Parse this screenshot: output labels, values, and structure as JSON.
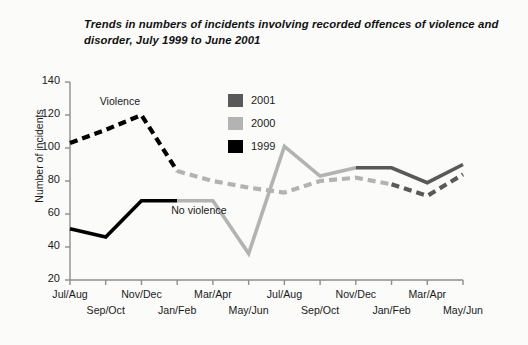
{
  "chart_data": {
    "type": "line",
    "title": "Trends in numbers of incidents involving recorded offences of violence and disorder, July 1999 to June 2001",
    "xlabel": "",
    "ylabel": "Number of incidents",
    "ylim": [
      20,
      140
    ],
    "ytick_values": [
      20,
      40,
      60,
      80,
      100,
      120,
      140
    ],
    "grid": false,
    "legend_position": "inside-top-right",
    "categories": [
      "Jul/Aug",
      "Sep/Oct",
      "Nov/Dec",
      "Jan/Feb",
      "Mar/Apr",
      "May/Jun",
      "Jul/Aug",
      "Sep/Oct",
      "Nov/Dec",
      "Jan/Feb",
      "Mar/Apr",
      "May/Jun"
    ],
    "legend": [
      {
        "label": "2001",
        "color": "#595959"
      },
      {
        "label": "2000",
        "color": "#b3b3b3"
      },
      {
        "label": "1999",
        "color": "#000000"
      }
    ],
    "annotations": [
      {
        "text": "Violence",
        "category_index": 1,
        "value": 128
      },
      {
        "text": "No violence",
        "category_index": 3,
        "value": 62
      }
    ],
    "series": [
      {
        "name": "Violence",
        "style": "dashed",
        "values": [
          103,
          111,
          120,
          86,
          80,
          76,
          73,
          80,
          82,
          78,
          71,
          84
        ],
        "segments": [
          {
            "year": "1999",
            "color": "#000000",
            "from": 0,
            "to": 3
          },
          {
            "year": "2000",
            "color": "#b3b3b3",
            "from": 3,
            "to": 9
          },
          {
            "year": "2001",
            "color": "#595959",
            "from": 9,
            "to": 11
          }
        ]
      },
      {
        "name": "No violence",
        "style": "solid",
        "values": [
          51,
          46,
          68,
          68,
          68,
          36,
          101,
          83,
          88,
          88,
          79,
          90
        ],
        "segments": [
          {
            "year": "1999",
            "color": "#000000",
            "from": 0,
            "to": 3
          },
          {
            "year": "2000",
            "color": "#b3b3b3",
            "from": 3,
            "to": 8
          },
          {
            "year": "2001",
            "color": "#595959",
            "from": 8,
            "to": 11
          }
        ]
      }
    ]
  }
}
